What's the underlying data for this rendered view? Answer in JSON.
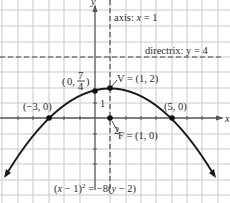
{
  "diagram": {
    "equation": "(x − 1)² = −8(y − 2)",
    "equation_parts": {
      "a": "(",
      "x": "x",
      "b": " − 1)",
      "sup": "2",
      "c": " = −8(",
      "y": "y",
      "d": " − 2)"
    },
    "axis_label_x": "x",
    "axis_label_y": "y",
    "tick_label_1": "1",
    "tick_label_2": "2",
    "axis_of_symmetry": {
      "text_prefix": "axis: ",
      "var": "x",
      "text_suffix": " = 1",
      "full": "axis: x = 1"
    },
    "directrix": {
      "text": "directrix: y = 4"
    },
    "points": {
      "y_intercept": {
        "label_open": "(0, ",
        "num": "7",
        "den": "4",
        "label_close": ")",
        "full": "(0, 7/4)"
      },
      "vertex": {
        "label": "V = (1, 2)"
      },
      "focus": {
        "label": "F = (1, 0)"
      },
      "x_int_left": {
        "label": "(−3, 0)"
      },
      "x_int_right": {
        "label": "(5, 0)"
      }
    },
    "colors": {
      "grid": "#c9c9c9",
      "axes": "#555555",
      "curve": "#1a1a1a",
      "dashed": "#444444",
      "text": "#2a2a2a"
    }
  }
}
